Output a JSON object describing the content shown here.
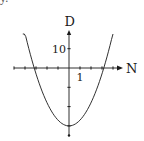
{
  "corner_fragment": "y.",
  "chart_data": {
    "type": "line",
    "title": "",
    "xlabel": "N",
    "ylabel": "D",
    "x_tick_label": "1",
    "y_tick_label": "10",
    "x_ticks": [
      -5,
      -4,
      -3,
      -2,
      -1,
      1,
      2,
      3,
      4
    ],
    "y_ticks": [
      10,
      -10,
      -20,
      -30
    ],
    "xlim": [
      -5,
      4.8
    ],
    "ylim": [
      -35,
      19
    ],
    "grid": false,
    "legend": null,
    "series": [
      {
        "name": "D vs N (parabola, D = 3N^2 - 30)",
        "x": [
          -4.2,
          -3.5,
          -3.16,
          -2.5,
          -2,
          -1,
          0,
          1,
          2,
          2.5,
          3.16,
          3.5,
          4.0
        ],
        "y": [
          22.9,
          6.75,
          0,
          -11.25,
          -18,
          -27,
          -30,
          -27,
          -18,
          -11.25,
          0,
          6.75,
          18
        ]
      }
    ],
    "annotations": {
      "roots": [
        -3.16,
        3.16
      ],
      "vertex": [
        0,
        -30
      ]
    }
  },
  "colors": {
    "ink": "#1a1a1a",
    "background": "#ffffff"
  }
}
